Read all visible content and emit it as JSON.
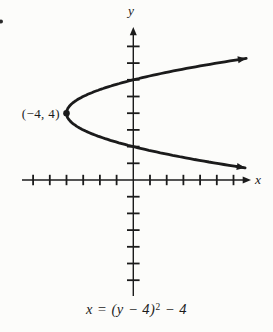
{
  "figure": {
    "colors": {
      "ink": "#1b1b1b",
      "background": "#fcfcfa"
    },
    "y_axis_label": "y",
    "x_axis_label": "x",
    "vertex_label": "(−4, 4)",
    "equation": {
      "base": "x = (y − 4)",
      "exponent": "2",
      "tail": " − 4"
    }
  },
  "chart_data": {
    "type": "line",
    "equation_text": "x = (y - 4)^2 - 4",
    "opens": "right",
    "vertex": {
      "x": -4,
      "y": 4
    },
    "vertex_label": "(−4, 4)",
    "xlabel": "x",
    "ylabel": "y",
    "xlim": [
      -6.6,
      7.0
    ],
    "ylim": [
      -7.0,
      9.1
    ],
    "x_ticks": [
      -6,
      -5,
      -4,
      -3,
      -2,
      -1,
      1,
      2,
      3,
      4,
      5,
      6
    ],
    "y_ticks": [
      -6,
      -5,
      -4,
      -3,
      -2,
      -1,
      1,
      2,
      3,
      4,
      5,
      6,
      7,
      8
    ],
    "grid": false,
    "curve_y_range": [
      0.73,
      7.28
    ],
    "key_points": [
      {
        "x": -4,
        "y": 4,
        "note": "vertex"
      },
      {
        "x": 0,
        "y": 6,
        "note": "upper y-intercept"
      },
      {
        "x": 0,
        "y": 2,
        "note": "lower y-intercept"
      }
    ]
  }
}
